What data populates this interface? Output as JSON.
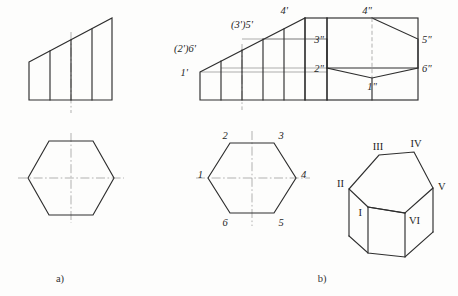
{
  "figure": {
    "captions": {
      "a": "a)",
      "b": "b)"
    },
    "colors": {
      "outline": "#2e2e2e",
      "thin": "#6a6a6a",
      "centerline": "#8f8f8f",
      "background": "#fdfdfc",
      "label": "#262626"
    }
  },
  "part_a": {
    "name": "a)",
    "front_view": {
      "shape": "right trapezoid",
      "description": "Front view: trapezoid rising left to right with four interior vertical element lines",
      "vertices": [
        [
          29,
          62
        ],
        [
          112,
          18
        ],
        [
          112,
          100
        ],
        [
          29,
          100
        ]
      ],
      "division_x": [
        50,
        71,
        92
      ],
      "centerline_x": 71
    },
    "top_view": {
      "shape": "regular hexagon",
      "description": "Top view: regular hexagon with horizontal and vertical centre lines",
      "center": [
        71,
        178
      ],
      "radius_x": 43,
      "radius_y": 37
    }
  },
  "part_b": {
    "name": "b)",
    "front_view": {
      "shape": "truncated hexagonal prism front view",
      "description": "Front view with inclined cut edge and labelled points",
      "box": [
        200,
        72,
        327,
        100
      ],
      "division_x": [
        221,
        242,
        263,
        284
      ],
      "incline": [
        [
          200,
          72
        ],
        [
          305,
          18
        ]
      ],
      "labels": [
        {
          "text": "1'",
          "x": 188,
          "y": 76
        },
        {
          "text": "(2')6'",
          "x": 196,
          "y": 52
        },
        {
          "text": "(3')5'",
          "x": 236,
          "y": 28
        },
        {
          "text": "4'",
          "x": 283,
          "y": 14
        }
      ]
    },
    "side_view": {
      "shape": "hexagon inscribed in rectangle",
      "description": "Left side view: hexagonal section inside rectangular outline",
      "box": [
        327,
        18,
        418,
        100
      ],
      "hexagon": [
        [
          372,
          18
        ],
        [
          418,
          39
        ],
        [
          418,
          68
        ],
        [
          372,
          78
        ],
        [
          327,
          68
        ],
        [
          327,
          39
        ]
      ],
      "center_x": 372,
      "labels": [
        {
          "text": "4\"",
          "x": 367,
          "y": 14
        },
        {
          "text": "5\"",
          "x": 423,
          "y": 42
        },
        {
          "text": "3\"",
          "x": 311,
          "y": 42
        },
        {
          "text": "6\"",
          "x": 423,
          "y": 71
        },
        {
          "text": "2\"",
          "x": 311,
          "y": 71
        },
        {
          "text": "1\"",
          "x": 368,
          "y": 89
        }
      ]
    },
    "top_view": {
      "shape": "regular hexagon with numbered vertices",
      "description": "Top view hexagon with vertices numbered 1 to 6",
      "center": [
        252,
        178
      ],
      "radius_x": 44,
      "radius_y": 38,
      "vertex_labels": [
        {
          "text": "1",
          "x": 197,
          "y": 178
        },
        {
          "text": "2",
          "x": 221,
          "y": 139
        },
        {
          "text": "3",
          "x": 283,
          "y": 139
        },
        {
          "text": "4",
          "x": 303,
          "y": 178
        },
        {
          "text": "5",
          "x": 283,
          "y": 223
        },
        {
          "text": "6",
          "x": 221,
          "y": 223
        }
      ]
    },
    "isometric_view": {
      "shape": "truncated hexagonal prism pictorial",
      "description": "Isometric pictorial of the hexagonal prism cut by an inclined plane, vertices in Roman numerals",
      "vertex_labels": [
        {
          "text": "I",
          "x": 362,
          "y": 213
        },
        {
          "text": "II",
          "x": 340,
          "y": 185
        },
        {
          "text": "III",
          "x": 376,
          "y": 146
        },
        {
          "text": "IV",
          "x": 414,
          "y": 143
        },
        {
          "text": "V",
          "x": 437,
          "y": 185
        },
        {
          "text": "VI",
          "x": 408,
          "y": 219
        }
      ]
    }
  }
}
